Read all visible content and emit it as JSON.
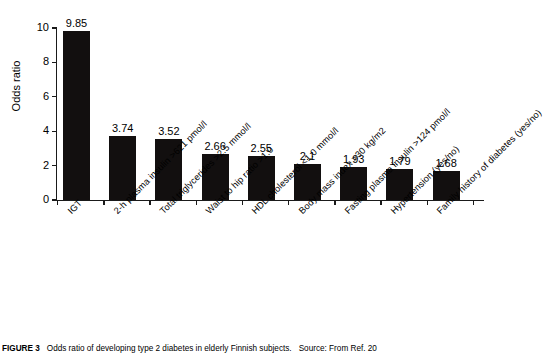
{
  "chart_data": {
    "type": "bar",
    "title": "",
    "xlabel": "",
    "ylabel": "Odds ratio",
    "ylim": [
      0,
      10
    ],
    "yticks": [
      0,
      2,
      4,
      6,
      8,
      10
    ],
    "grid": false,
    "legend": null,
    "bar_color": "#120f0f",
    "categories": [
      "IGT",
      "2-h plasma insulin >621 pmol/l",
      "Total triglycerides >2.5 mmol/l",
      "Waist to hip ratio >1.0",
      "HDL cholesterol <1.0 mmol/l",
      "Body mass index >30 kg/m2",
      "Fasting plasma insulin >124 pmol/l",
      "Hypertension (yes/no)",
      "Family history of diabetes (yes/no)"
    ],
    "values": [
      9.85,
      3.74,
      3.52,
      2.66,
      2.55,
      2.1,
      1.93,
      1.79,
      1.68
    ],
    "value_labels": [
      "9.85",
      "3.74",
      "3.52",
      "2.66",
      "2.55",
      "2.1",
      "1.93",
      "1.79",
      "1.68"
    ]
  },
  "caption": {
    "lead": "FIGURE 3",
    "text": "Odds ratio of developing type 2 diabetes in elderly Finnish subjects.",
    "source": "Source: From Ref. 20"
  }
}
